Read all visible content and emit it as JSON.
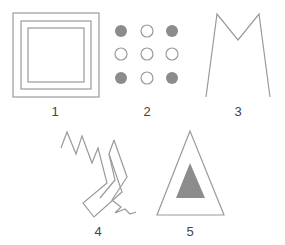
{
  "figures": [
    {
      "id": 1,
      "label": "1",
      "shape": "nested-squares",
      "description": "Three concentric squares"
    },
    {
      "id": 2,
      "label": "2",
      "shape": "dot-grid",
      "description": "3x3 grid of circles; corners filled gray, others outlined",
      "grid": [
        [
          "filled",
          "open",
          "filled"
        ],
        [
          "open",
          "open",
          "open"
        ],
        [
          "filled",
          "open",
          "filled"
        ]
      ]
    },
    {
      "id": 3,
      "label": "3",
      "shape": "m-shape",
      "description": "Open M-shaped line figure"
    },
    {
      "id": 4,
      "label": "4",
      "shape": "zigzag-chevrons",
      "description": "Two jagged chevron-like line shapes"
    },
    {
      "id": 5,
      "label": "5",
      "shape": "triangle-in-triangle",
      "description": "Outlined triangle containing a filled gray triangle"
    }
  ],
  "colors": {
    "stroke": "#9a9a9a",
    "fill": "#8c8c8c",
    "label": "#444444"
  }
}
